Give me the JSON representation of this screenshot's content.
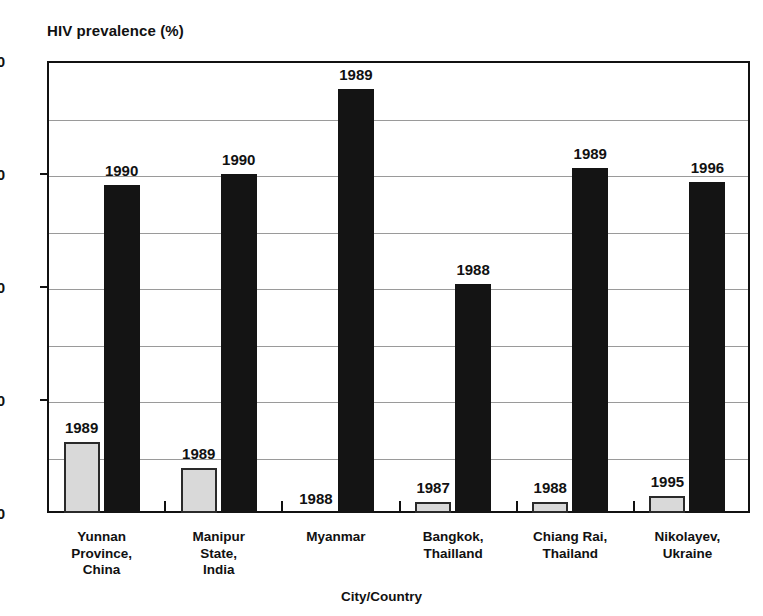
{
  "chart_data": {
    "type": "bar",
    "title": "",
    "ylabel": "HIV prevalence (%)",
    "xlabel": "City/Country",
    "ylim": [
      0,
      80
    ],
    "yticks": [
      0,
      20,
      40,
      60,
      80
    ],
    "ytick_labels": [
      "0",
      "20",
      "40",
      "60",
      "80"
    ],
    "minor_gridlines": [
      10,
      30,
      50,
      70
    ],
    "grid": true,
    "legend": "none",
    "categories": [
      "Yunnan Province, China",
      "Manipur State, India",
      "Myanmar",
      "Bangkok, Thailland",
      "Chiang Rai, Thailand",
      "Nikolayev, Ukraine"
    ],
    "category_lines": [
      [
        "Yunnan",
        "Province,",
        "China"
      ],
      [
        "Manipur",
        "State,",
        "India"
      ],
      [
        "Myanmar"
      ],
      [
        "Bangkok,",
        "Thailland"
      ],
      [
        "Chiang Rai,",
        "Thailand"
      ],
      [
        "Nikolayev,",
        "Ukraine"
      ]
    ],
    "series": [
      {
        "name": "earlier year",
        "color": "#d9d9d9",
        "values": [
          12.5,
          8,
          0,
          2,
          2,
          3
        ],
        "point_labels": [
          "1989",
          "1989",
          "1988",
          "1987",
          "1988",
          "1995"
        ]
      },
      {
        "name": "later year",
        "color": "#141414",
        "values": [
          58,
          60,
          75,
          40.5,
          61,
          58.5
        ],
        "point_labels": [
          "1990",
          "1990",
          "1989",
          "1988",
          "1989",
          "1996"
        ]
      }
    ]
  }
}
